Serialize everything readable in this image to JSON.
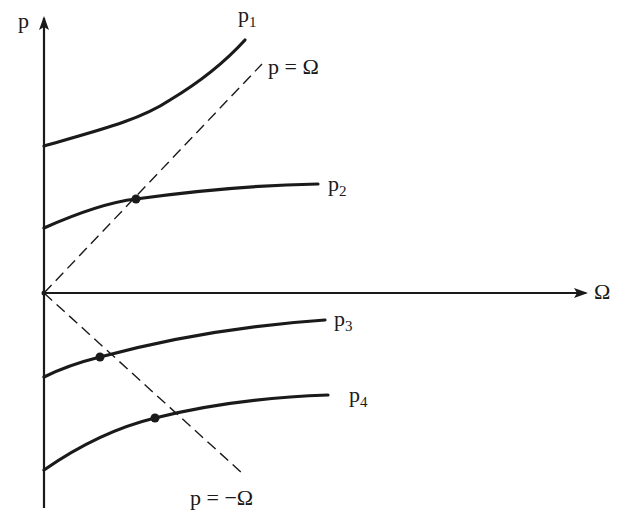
{
  "diagram": {
    "axes": {
      "y_label": "p",
      "x_label": "Ω"
    },
    "curves": [
      {
        "id": "p1",
        "label_base": "p",
        "label_sub": "1"
      },
      {
        "id": "p2",
        "label_base": "p",
        "label_sub": "2"
      },
      {
        "id": "p3",
        "label_base": "p",
        "label_sub": "3"
      },
      {
        "id": "p4",
        "label_base": "p",
        "label_sub": "4"
      }
    ],
    "dashed_lines": [
      {
        "id": "p-equals-omega",
        "label": "p = Ω"
      },
      {
        "id": "p-equals-minus-omega",
        "label": "p = −Ω"
      }
    ],
    "intersection_points": [
      {
        "curve": "p2",
        "line": "p = Ω"
      },
      {
        "curve": "p3",
        "line": "p = −Ω"
      },
      {
        "curve": "p4",
        "line": "p = −Ω"
      }
    ],
    "colors": {
      "ink": "#1a1a1a",
      "background": "#ffffff"
    }
  }
}
